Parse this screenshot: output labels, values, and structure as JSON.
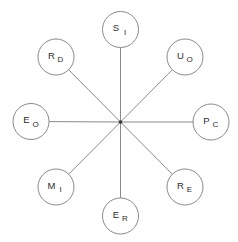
{
  "diagram": {
    "type": "radial-star",
    "canvas": {
      "width": 238,
      "height": 242
    },
    "background_color": "#ffffff",
    "stroke_color": "#8a8a8a",
    "text_color": "#2b2b2b",
    "hub": {
      "label": "center-hub",
      "x": 120.5,
      "y": 122,
      "dot_radius": 1.8
    },
    "node_radius": 18,
    "spoke_length": 90,
    "nodes": [
      {
        "id": "node-si",
        "main": "S",
        "sub": "I",
        "angle_deg": 90,
        "position": "top",
        "cx": 120.5,
        "cy": 29.5
      },
      {
        "id": "node-uo",
        "main": "U",
        "sub": "O",
        "angle_deg": 45,
        "position": "top-right",
        "cx": 185,
        "cy": 57
      },
      {
        "id": "node-pc",
        "main": "P",
        "sub": "C",
        "angle_deg": 0,
        "position": "right",
        "cx": 211,
        "cy": 122
      },
      {
        "id": "node-re",
        "main": "R",
        "sub": "E",
        "angle_deg": 315,
        "position": "bottom-right",
        "cx": 185,
        "cy": 187
      },
      {
        "id": "node-er",
        "main": "E",
        "sub": "R",
        "angle_deg": 270,
        "position": "bottom",
        "cx": 120.5,
        "cy": 216
      },
      {
        "id": "node-mi",
        "main": "M",
        "sub": "I",
        "angle_deg": 225,
        "position": "bottom-left",
        "cx": 56,
        "cy": 187
      },
      {
        "id": "node-eo",
        "main": "E",
        "sub": "O",
        "angle_deg": 180,
        "position": "left",
        "cx": 31,
        "cy": 121.5
      },
      {
        "id": "node-rd",
        "main": "R",
        "sub": "D",
        "angle_deg": 135,
        "position": "top-left",
        "cx": 56,
        "cy": 57
      }
    ]
  }
}
